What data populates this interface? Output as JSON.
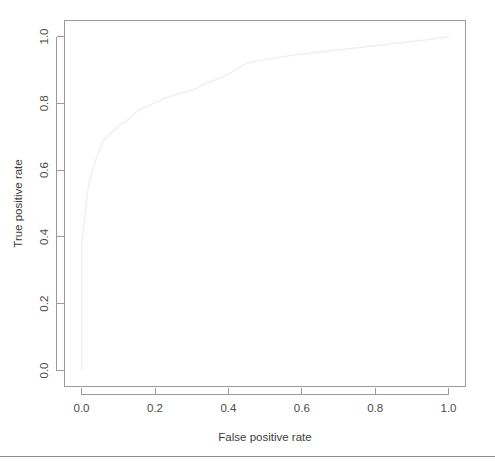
{
  "chart_data": {
    "type": "line",
    "title": "",
    "xlabel": "False positive rate",
    "ylabel": "True positive rate",
    "xlim": [
      0,
      1
    ],
    "ylim": [
      0,
      1
    ],
    "grid": false,
    "legend": "none",
    "xticks": [
      "0.0",
      "0.2",
      "0.4",
      "0.6",
      "0.8",
      "1.0"
    ],
    "xtick_values": [
      0.0,
      0.2,
      0.4,
      0.6,
      0.8,
      1.0
    ],
    "yticks": [
      "0.0",
      "0.2",
      "0.4",
      "0.6",
      "0.8",
      "1.0"
    ],
    "ytick_values": [
      0.0,
      0.2,
      0.4,
      0.6,
      0.8,
      1.0
    ],
    "series": [
      {
        "name": "ROC curve",
        "color": "#f2eef0",
        "x": [
          0.0,
          0.0,
          0.005,
          0.01,
          0.015,
          0.02,
          0.03,
          0.04,
          0.05,
          0.055,
          0.06,
          0.075,
          0.09,
          0.105,
          0.12,
          0.135,
          0.15,
          0.165,
          0.18,
          0.195,
          0.21,
          0.225,
          0.24,
          0.255,
          0.27,
          0.285,
          0.3,
          0.315,
          0.33,
          0.345,
          0.36,
          0.375,
          0.39,
          0.405,
          0.42,
          0.435,
          0.45,
          0.47,
          0.5,
          0.54,
          0.58,
          0.62,
          0.66,
          0.7,
          0.74,
          0.78,
          0.82,
          0.86,
          0.9,
          0.94,
          0.97,
          1.0
        ],
        "y": [
          0.0,
          0.38,
          0.42,
          0.47,
          0.52,
          0.56,
          0.6,
          0.635,
          0.66,
          0.68,
          0.69,
          0.705,
          0.72,
          0.735,
          0.745,
          0.76,
          0.775,
          0.785,
          0.79,
          0.8,
          0.805,
          0.815,
          0.82,
          0.825,
          0.83,
          0.835,
          0.84,
          0.845,
          0.855,
          0.862,
          0.868,
          0.875,
          0.882,
          0.89,
          0.9,
          0.91,
          0.92,
          0.925,
          0.93,
          0.938,
          0.945,
          0.95,
          0.955,
          0.96,
          0.965,
          0.97,
          0.975,
          0.98,
          0.985,
          0.99,
          0.995,
          1.0
        ]
      }
    ]
  },
  "axes": {
    "x_title": "False positive rate",
    "y_title": "True positive rate"
  },
  "labels": {
    "x": [
      "0.0",
      "0.2",
      "0.4",
      "0.6",
      "0.8",
      "1.0"
    ],
    "y": [
      "0.0",
      "0.2",
      "0.4",
      "0.6",
      "0.8",
      "1.0"
    ]
  }
}
